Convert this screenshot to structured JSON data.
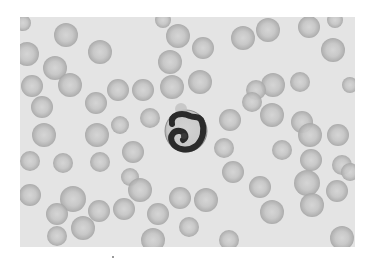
{
  "image": {
    "subject": "Peripheral blood smear with a segmented neutrophil among red blood cells",
    "background_color": "#ffffff",
    "field_color": "#e4e4e4",
    "rbc_center_color": "#cfcfcf",
    "rbc_rim_color": "#a9a9a9",
    "nucleus_color": "#2b2b2b",
    "cytoplasm_color": "#d8d8d8",
    "frame": {
      "x": 20,
      "y": 17,
      "width": 335,
      "height": 230
    }
  },
  "neutrophil": {
    "cx": 186,
    "cy": 131,
    "r": 21
  },
  "red_blood_cells": [
    [
      66,
      35,
      12
    ],
    [
      27,
      54,
      12
    ],
    [
      55,
      68,
      12
    ],
    [
      100,
      52,
      12
    ],
    [
      32,
      86,
      11
    ],
    [
      70,
      85,
      12
    ],
    [
      118,
      90,
      11
    ],
    [
      23,
      23,
      8
    ],
    [
      178,
      36,
      12
    ],
    [
      203,
      48,
      11
    ],
    [
      170,
      62,
      12
    ],
    [
      172,
      87,
      12
    ],
    [
      200,
      82,
      12
    ],
    [
      243,
      38,
      12
    ],
    [
      143,
      90,
      11
    ],
    [
      163,
      20,
      8
    ],
    [
      268,
      30,
      12
    ],
    [
      309,
      27,
      11
    ],
    [
      335,
      20,
      8
    ],
    [
      333,
      50,
      12
    ],
    [
      273,
      85,
      12
    ],
    [
      300,
      82,
      10
    ],
    [
      350,
      85,
      8
    ],
    [
      256,
      90,
      10
    ],
    [
      42,
      107,
      11
    ],
    [
      96,
      103,
      11
    ],
    [
      44,
      135,
      12
    ],
    [
      97,
      135,
      12
    ],
    [
      30,
      161,
      10
    ],
    [
      63,
      163,
      10
    ],
    [
      100,
      162,
      10
    ],
    [
      133,
      152,
      11
    ],
    [
      272,
      115,
      12
    ],
    [
      302,
      122,
      11
    ],
    [
      310,
      135,
      12
    ],
    [
      338,
      135,
      11
    ],
    [
      282,
      150,
      10
    ],
    [
      311,
      160,
      11
    ],
    [
      342,
      165,
      10
    ],
    [
      252,
      102,
      10
    ],
    [
      30,
      195,
      11
    ],
    [
      73,
      199,
      13
    ],
    [
      57,
      214,
      11
    ],
    [
      99,
      211,
      11
    ],
    [
      124,
      209,
      11
    ],
    [
      83,
      228,
      12
    ],
    [
      57,
      236,
      10
    ],
    [
      130,
      177,
      9
    ],
    [
      140,
      190,
      12
    ],
    [
      180,
      198,
      11
    ],
    [
      206,
      200,
      12
    ],
    [
      158,
      214,
      11
    ],
    [
      189,
      227,
      10
    ],
    [
      233,
      172,
      11
    ],
    [
      153,
      240,
      12
    ],
    [
      229,
      240,
      10
    ],
    [
      260,
      187,
      11
    ],
    [
      307,
      183,
      13
    ],
    [
      312,
      205,
      12
    ],
    [
      337,
      191,
      11
    ],
    [
      272,
      212,
      12
    ],
    [
      342,
      238,
      12
    ],
    [
      350,
      172,
      9
    ],
    [
      230,
      120,
      11
    ],
    [
      224,
      148,
      10
    ],
    [
      150,
      118,
      10
    ],
    [
      120,
      125,
      9
    ]
  ]
}
